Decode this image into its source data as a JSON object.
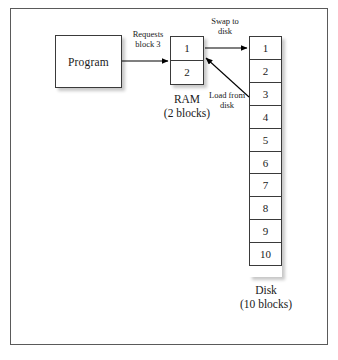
{
  "diagram": {
    "program": {
      "label": "Program"
    },
    "ram": {
      "blocks": [
        "1",
        "2"
      ],
      "caption_name": "RAM",
      "caption_count": "(2 blocks)"
    },
    "disk": {
      "blocks": [
        "1",
        "2",
        "3",
        "4",
        "5",
        "6",
        "7",
        "8",
        "9",
        "10"
      ],
      "caption_name": "Disk",
      "caption_count": "(10 blocks)"
    },
    "arrows": {
      "requests": {
        "line1": "Requests",
        "line2": "block 3"
      },
      "swap": {
        "line1": "Swap to",
        "line2": "disk"
      },
      "load": {
        "line1": "Load from",
        "line2": "disk"
      }
    },
    "colors": {
      "frame_border": "#5a5a5a",
      "box_border": "#3a3a3a",
      "arrow": "#000000",
      "background": "#ffffff",
      "text": "#1a1a1a"
    }
  }
}
